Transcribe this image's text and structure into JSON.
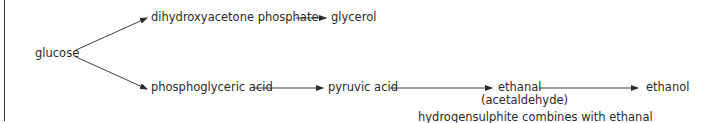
{
  "diagram": {
    "type": "flowchart",
    "nodes": {
      "glucose": "glucose",
      "dhap": "dihydroxyacetone phosphate",
      "glycerol": "glycerol",
      "pga": "phosphoglyceric acid",
      "pyruvic": "pyruvic acid",
      "ethanal": "ethanal",
      "ethanal_alt": "(acetaldehyde)",
      "ethanol": "ethanol"
    },
    "annotation": "hydrogensulphite combines with ethanal",
    "edges": [
      {
        "from": "glucose",
        "to": "dihydroxyacetone phosphate"
      },
      {
        "from": "dihydroxyacetone phosphate",
        "to": "glycerol"
      },
      {
        "from": "glucose",
        "to": "phosphoglyceric acid"
      },
      {
        "from": "phosphoglyceric acid",
        "to": "pyruvic acid"
      },
      {
        "from": "pyruvic acid",
        "to": "ethanal"
      },
      {
        "from": "ethanal",
        "to": "ethanol"
      }
    ],
    "colors": {
      "line": "#2a2a2a",
      "text": "#2a2a2a",
      "background": "#ffffff"
    }
  }
}
